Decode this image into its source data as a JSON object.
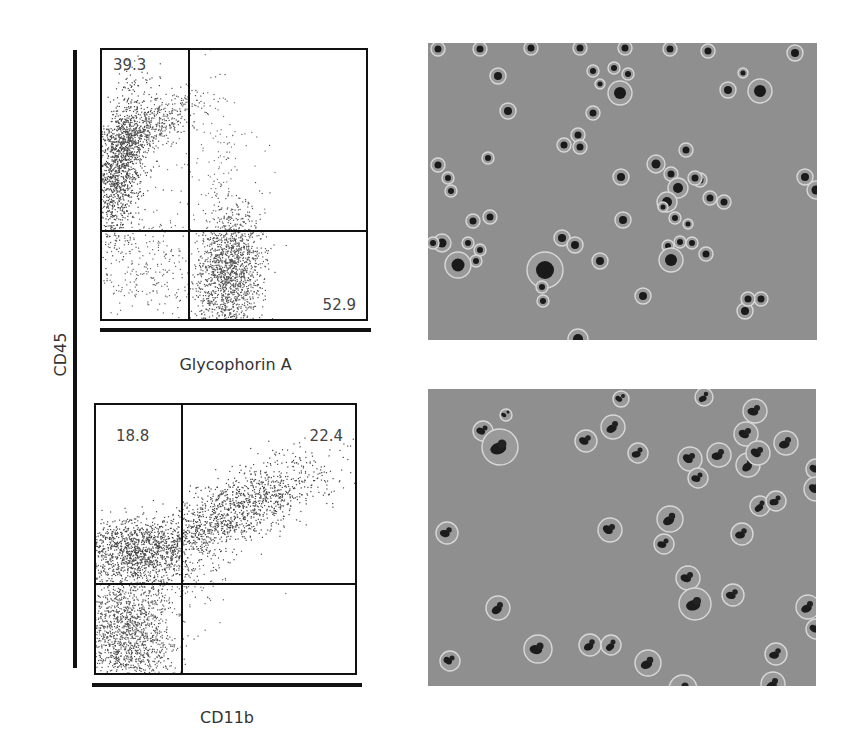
{
  "figure": {
    "shared_y_axis_label": "CD45",
    "panels": [
      {
        "id": "flow-plot-glycophorin",
        "type": "flow-cytometry-dot-plot",
        "x_axis_label": "Glycophorin A",
        "y_axis_label": "CD45",
        "quadrant_labels": {
          "upper_left": "39.3",
          "lower_right": "52.9"
        }
      },
      {
        "id": "flow-plot-cd11b",
        "type": "flow-cytometry-dot-plot",
        "x_axis_label": "CD11b",
        "y_axis_label": "CD45",
        "quadrant_labels": {
          "upper_left": "18.8",
          "upper_right": "22.4"
        }
      },
      {
        "id": "micrograph-top",
        "type": "microscopy-image",
        "description": "round cells with dark nuclei, erythroid cluster"
      },
      {
        "id": "micrograph-bottom",
        "type": "microscopy-image",
        "description": "cells with dark lobed nuclei (myeloid)"
      }
    ]
  },
  "chart_data": [
    {
      "type": "scatter",
      "title": "",
      "xlabel": "Glycophorin A",
      "ylabel": "CD45",
      "grid": false,
      "quadrant_gates": true,
      "quadrants": {
        "upper_left": 39.3,
        "upper_right": null,
        "lower_left": null,
        "lower_right": 52.9
      },
      "populations": [
        {
          "name": "CD45+ GlyA-",
          "quadrant": "upper_left",
          "center_rel": [
            0.07,
            0.45
          ]
        },
        {
          "name": "CD45- GlyA+",
          "quadrant": "lower_right",
          "center_rel": [
            0.46,
            0.84
          ]
        }
      ]
    },
    {
      "type": "scatter",
      "title": "",
      "xlabel": "CD11b",
      "ylabel": "CD45",
      "grid": false,
      "quadrant_gates": true,
      "quadrants": {
        "upper_left": 18.8,
        "upper_right": 22.4,
        "lower_left": null,
        "lower_right": null
      },
      "populations": [
        {
          "name": "CD45+ CD11b-",
          "quadrant": "upper_left",
          "center_rel": [
            0.1,
            0.5
          ]
        },
        {
          "name": "CD45+ CD11b+",
          "quadrant": "upper_right",
          "center_rel": [
            0.62,
            0.3
          ]
        },
        {
          "name": "CD45- CD11b-",
          "quadrant": "lower_left",
          "center_rel": [
            0.1,
            0.85
          ]
        }
      ]
    }
  ]
}
